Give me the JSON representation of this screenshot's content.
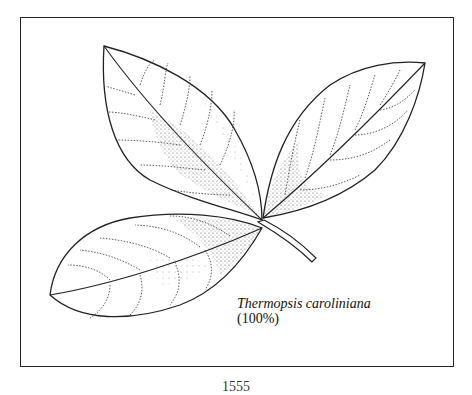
{
  "figure": {
    "caption_name": "Thermopsis caroliniana",
    "caption_scale": "(100%)",
    "leaves": [
      "top-left-leaflet",
      "right-leaflet",
      "bottom-left-leaflet"
    ]
  },
  "page": {
    "number_partial": "1555"
  },
  "colors": {
    "ink": "#222222",
    "background": "#ffffff"
  }
}
